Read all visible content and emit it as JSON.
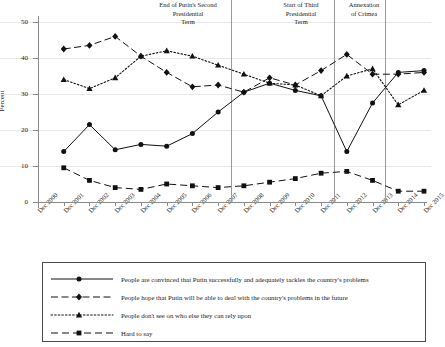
{
  "chart_data": {
    "type": "line",
    "title": "",
    "xlabel": "",
    "ylabel": "Percent",
    "ylim": [
      0,
      50
    ],
    "yticks": [
      0,
      10,
      20,
      30,
      40,
      50
    ],
    "grid": true,
    "legend_position": "below-plot",
    "categories": [
      "Dec 2000",
      "Dec 2001",
      "Dec 2002",
      "Dec 2003",
      "Dec 2004",
      "Dec 2005",
      "Dec 2006",
      "Dec 2007",
      "Dec 2008",
      "Dec 2009",
      "Dec 2010",
      "Dec 2011",
      "Dec 2012",
      "Dec 2013",
      "Dec 2014",
      "Dec 2015"
    ],
    "series": [
      {
        "name": "People are convinced that Putin successfully and adequately tackles the country's problems",
        "marker": "circle",
        "linestyle": "solid",
        "x": [
          "Dec 2001",
          "Dec 2002",
          "Dec 2003",
          "Dec 2004",
          "Dec 2005",
          "Dec 2006",
          "Dec 2007",
          "Dec 2008",
          "Dec 2009",
          "Dec 2010",
          "Dec 2011",
          "Dec 2012",
          "Dec 2013",
          "Dec 2014",
          "Dec 2015"
        ],
        "values": [
          14,
          21.5,
          14.5,
          16,
          15.5,
          19,
          25,
          30.5,
          33,
          31,
          29.5,
          14,
          27.5,
          36,
          36.5
        ]
      },
      {
        "name": "People hope that Putin will be able to deal with the country's problems in the future",
        "marker": "diamond",
        "linestyle": "dashed",
        "x": [
          "Dec 2001",
          "Dec 2002",
          "Dec 2003",
          "Dec 2004",
          "Dec 2005",
          "Dec 2006",
          "Dec 2007",
          "Dec 2008",
          "Dec 2009",
          "Dec 2010",
          "Dec 2011",
          "Dec 2012",
          "Dec 2013",
          "Dec 2014",
          "Dec 2015"
        ],
        "values": [
          42.5,
          43.5,
          46,
          40.5,
          36,
          32,
          32.5,
          30.5,
          34.5,
          32.5,
          36.5,
          41,
          35.5,
          35.5,
          36
        ]
      },
      {
        "name": "People don't see on who else they can rely upon",
        "marker": "triangle",
        "linestyle": "dotted",
        "x": [
          "Dec 2001",
          "Dec 2002",
          "Dec 2003",
          "Dec 2004",
          "Dec 2005",
          "Dec 2006",
          "Dec 2007",
          "Dec 2008",
          "Dec 2009",
          "Dec 2010",
          "Dec 2011",
          "Dec 2012",
          "Dec 2013",
          "Dec 2014",
          "Dec 2015"
        ],
        "values": [
          34,
          31.5,
          34.5,
          40.5,
          42,
          40.5,
          38,
          35.5,
          33,
          32.5,
          29.5,
          35,
          37,
          27,
          31
        ]
      },
      {
        "name": "Hard to say",
        "marker": "square",
        "linestyle": "long-dash",
        "x": [
          "Dec 2001",
          "Dec 2002",
          "Dec 2003",
          "Dec 2004",
          "Dec 2005",
          "Dec 2006",
          "Dec 2007",
          "Dec 2008",
          "Dec 2009",
          "Dec 2010",
          "Dec 2011",
          "Dec 2012",
          "Dec 2013",
          "Dec 2014",
          "Dec 2015"
        ],
        "values": [
          9.5,
          6,
          4,
          3.5,
          5,
          4.5,
          4,
          4.5,
          5.5,
          6.5,
          8,
          8.5,
          6,
          3,
          3
        ]
      }
    ],
    "annotations": [
      {
        "id": "end-second-term",
        "text": "End of Putin's Second\nPresidential\nTerm",
        "at_x": "between Dec 2007 and Dec 2008"
      },
      {
        "id": "start-third-term",
        "text": "Start of Third\nPresidential\nTerm",
        "at_x": "Dec 2011 / 2012"
      },
      {
        "id": "annexation-crimea",
        "text": "Annexation\nof Crimea",
        "at_x": "Dec 2013 / 2014"
      }
    ]
  },
  "axis": {
    "ylabel": "Percent",
    "yticks": [
      "0",
      "10",
      "20",
      "30",
      "40",
      "50"
    ],
    "xticks": [
      "Dec 2000",
      "Dec 2001",
      "Dec 2002",
      "Dec 2003",
      "Dec 2004",
      "Dec 2005",
      "Dec 2006",
      "Dec 2007",
      "Dec 2008",
      "Dec 2009",
      "Dec 2010",
      "Dec 2011",
      "Dec 2012",
      "Dec 2013",
      "Dec 2014",
      "Dec 2015"
    ]
  },
  "annotations": {
    "end_second_term": {
      "line1": "End of Putin's Second",
      "line2": "Presidential",
      "line3": "Term"
    },
    "start_third_term": {
      "line1": "Start of Third",
      "line2": "Presidential",
      "line3": "Term"
    },
    "annexation_crimea": {
      "line1": "Annexation",
      "line2": "of Crimea"
    }
  },
  "legend": {
    "items": [
      {
        "label": "People are convinced that Putin successfully and adequately tackles the country's problems"
      },
      {
        "label": "People hope that Putin will be able to deal with the country's problems in the future"
      },
      {
        "label": "People don't see on who else they can rely upon"
      },
      {
        "label": "Hard to say"
      }
    ]
  },
  "colors": {
    "ink": "#1a1a1a",
    "axis": "#8a8a8a",
    "grid": "#e8e8e8",
    "vline": "#9a9a9a",
    "legend_border": "#4a4a4a"
  }
}
